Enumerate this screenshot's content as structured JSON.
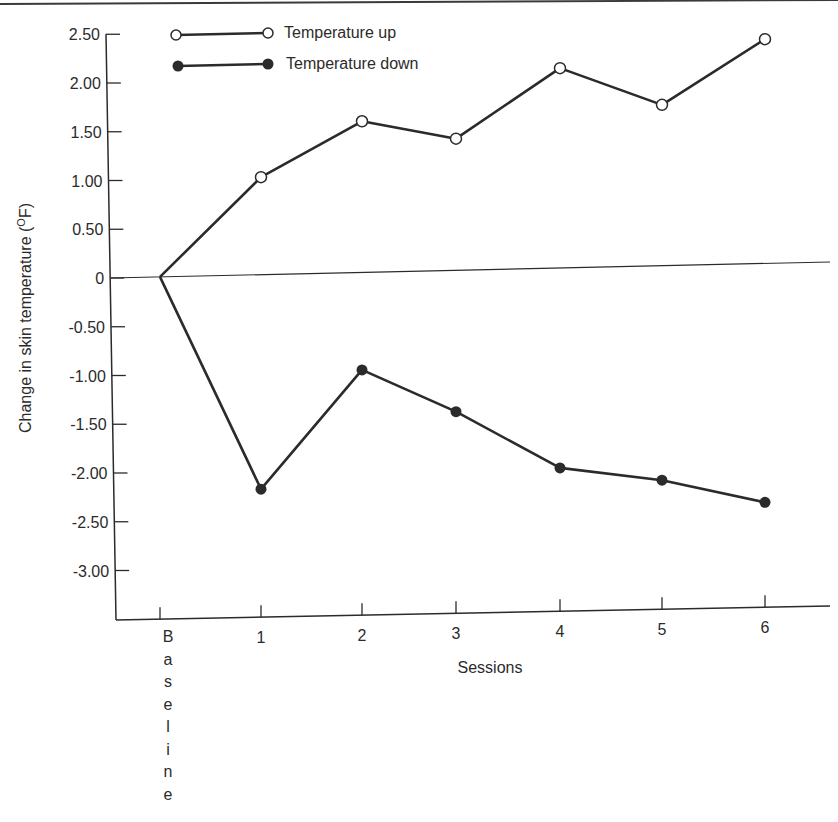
{
  "chart_data": {
    "type": "line",
    "title": "",
    "xlabel": "Sessions",
    "ylabel": "Change in skin temperature (°F)",
    "ylabel_parts": {
      "main": "Change in skin temperature (",
      "sup": "O",
      "unit": "F)"
    },
    "categories": [
      "B",
      "1",
      "2",
      "3",
      "4",
      "5",
      "6"
    ],
    "baseline_label_vertical": [
      "B",
      "a",
      "s",
      "e",
      "l",
      "i",
      "n",
      "e"
    ],
    "baseline_label": "Baseline",
    "yticks": [
      2.5,
      2.0,
      1.5,
      1.0,
      0.5,
      0,
      -0.5,
      -1.0,
      -1.5,
      -2.0,
      -2.5,
      -3.0
    ],
    "ytick_labels": [
      "2.50",
      "2.00",
      "1.50",
      "1.00",
      "0.50",
      "0",
      "-0.50",
      "-1.00",
      "-1.50",
      "-2.00",
      "-2.50",
      "-3.00"
    ],
    "ylim": [
      -3.5,
      2.5
    ],
    "grid": false,
    "zero_line": true,
    "legend_position": "top-left inside",
    "series": [
      {
        "name": "Temperature up",
        "marker": "open-circle",
        "color": "#2b2b2b",
        "values": [
          0,
          1.0,
          1.55,
          1.35,
          2.05,
          1.65,
          2.3
        ]
      },
      {
        "name": "Temperature down",
        "marker": "filled-circle",
        "color": "#2b2b2b",
        "values": [
          0,
          -2.2,
          -1.0,
          -1.45,
          -2.05,
          -2.2,
          -2.45
        ]
      }
    ]
  },
  "legend": {
    "up_label": "Temperature up",
    "down_label": "Temperature down"
  },
  "axes": {
    "x_title": "Sessions",
    "y_title_main": "Change in skin temperature (",
    "y_title_sup": "O",
    "y_title_end": "F)"
  }
}
